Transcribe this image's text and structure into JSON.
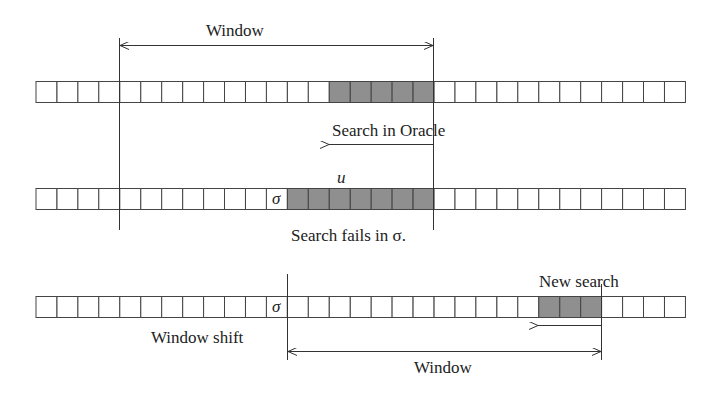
{
  "diagram": {
    "cell_count": 31,
    "strip_x0": 36,
    "cell_width": 20.95,
    "cell_height": 21,
    "shade_color": "#8f8f8f",
    "rows": [
      {
        "id": "row-1",
        "y": 81,
        "shaded_cells": [
          14,
          15,
          16,
          17,
          18
        ],
        "sigma_cell": null
      },
      {
        "id": "row-2",
        "y": 188,
        "shaded_cells": [
          12,
          13,
          14,
          15,
          16,
          17,
          18
        ],
        "sigma_cell": 11
      },
      {
        "id": "row-3",
        "y": 296,
        "shaded_cells": [
          24,
          25,
          26
        ],
        "sigma_cell": 11
      }
    ],
    "labels": {
      "window_top": "Window",
      "search_in_oracle": "Search in Oracle",
      "u_symbol": "u",
      "sigma_symbol": "σ",
      "search_fails": "Search fails in σ.",
      "new_search": "New search",
      "window_shift": "Window shift",
      "window_bottom": "Window"
    }
  }
}
